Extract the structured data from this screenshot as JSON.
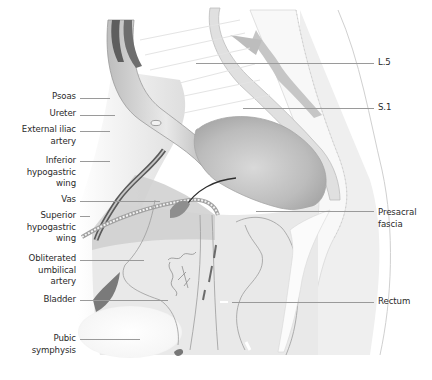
{
  "figure": {
    "type": "anatomical illustration",
    "view": "sagittal section of male pelvis",
    "colors": {
      "background": "#ffffff",
      "label_text": "#2a2a2a",
      "leader_line": "#9a9a9a",
      "tissue_light": "#e6e6e6",
      "tissue_mid": "#cfcfcf",
      "tissue_dark": "#8a8a8a",
      "vessel_dark": "#4a4a4a"
    }
  },
  "labels": {
    "left": [
      {
        "id": "psoas",
        "text": "Psoas"
      },
      {
        "id": "ureter",
        "text": "Ureter"
      },
      {
        "id": "external-iliac-artery",
        "text": "External iliac\nartery"
      },
      {
        "id": "inferior-hypogastric-wing",
        "text": "Inferior\nhypogastric\nwing"
      },
      {
        "id": "vas",
        "text": "Vas"
      },
      {
        "id": "superior-hypogastric-wing",
        "text": "Superior\nhypogastric\nwing"
      },
      {
        "id": "obliterated-umbilical-artery",
        "text": "Obliterated\numbilical\nartery"
      },
      {
        "id": "bladder",
        "text": "Bladder"
      },
      {
        "id": "pubic-symphysis",
        "text": "Pubic\nsymphysis"
      }
    ],
    "right": [
      {
        "id": "l5",
        "text": "L.5"
      },
      {
        "id": "s1",
        "text": "S.1"
      },
      {
        "id": "presacral-fascia",
        "text": "Presacral\nfascia"
      },
      {
        "id": "rectum",
        "text": "Rectum"
      }
    ]
  }
}
